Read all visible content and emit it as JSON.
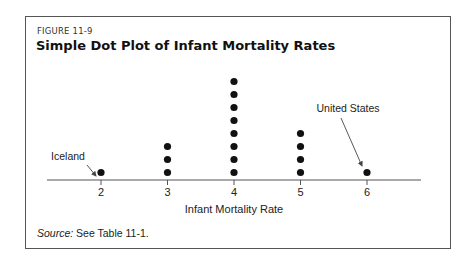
{
  "figure": {
    "number": "FIGURE 11-9",
    "title": "Simple Dot Plot of Infant Mortality Rates",
    "source_label": "Source:",
    "source_text": " See Table 11-1."
  },
  "chart_data": {
    "type": "scatter",
    "subtype": "dot_plot",
    "title": "Simple Dot Plot of Infant Mortality Rates",
    "xlabel": "Infant Mortality Rate",
    "ylabel": "",
    "categories": [
      2,
      3,
      4,
      5,
      6
    ],
    "values": [
      1,
      3,
      8,
      4,
      1
    ],
    "tick_labels": [
      "2",
      "3",
      "4",
      "5",
      "6"
    ],
    "annotations": [
      {
        "text": "Iceland",
        "x": 2
      },
      {
        "text": "United States",
        "x": 6
      }
    ],
    "grid": false,
    "legend": null,
    "source": "Source: See Table 11-1."
  }
}
